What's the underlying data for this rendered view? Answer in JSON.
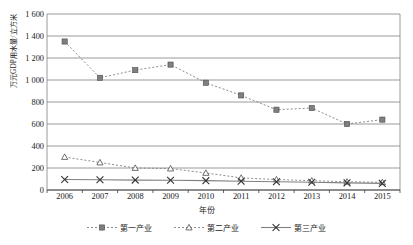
{
  "chart_data": {
    "type": "line",
    "title": "",
    "xlabel": "年份",
    "ylabel": "万元GDP用水量/立方米",
    "categories": [
      "2006",
      "2007",
      "2008",
      "2009",
      "2010",
      "2011",
      "2012",
      "2013",
      "2014",
      "2015"
    ],
    "ylim": [
      0,
      1600
    ],
    "ytick_labels": [
      "0",
      "200",
      "400",
      "600",
      "800",
      "1 000",
      "1 200",
      "1 400",
      "1 600"
    ],
    "ytick_values": [
      0,
      200,
      400,
      600,
      800,
      1000,
      1200,
      1400,
      1600
    ],
    "grid": true,
    "legend_position": "bottom",
    "series": [
      {
        "name": "第一产业",
        "marker": "square",
        "linestyle": "dashed",
        "color": "#7f7f7f",
        "values": [
          1350,
          1020,
          1090,
          1140,
          975,
          860,
          730,
          745,
          600,
          640
        ]
      },
      {
        "name": "第二产业",
        "marker": "triangle",
        "linestyle": "dashed",
        "color": "#7f7f7f",
        "values": [
          300,
          250,
          200,
          195,
          155,
          110,
          95,
          85,
          75,
          70
        ]
      },
      {
        "name": "第三产业",
        "marker": "x",
        "linestyle": "solid",
        "color": "#808080",
        "values": [
          95,
          93,
          90,
          88,
          85,
          80,
          75,
          70,
          65,
          60
        ]
      }
    ]
  },
  "axes": {
    "plot_left": 47,
    "plot_right": 400,
    "plot_top": 14,
    "plot_bottom": 190
  }
}
